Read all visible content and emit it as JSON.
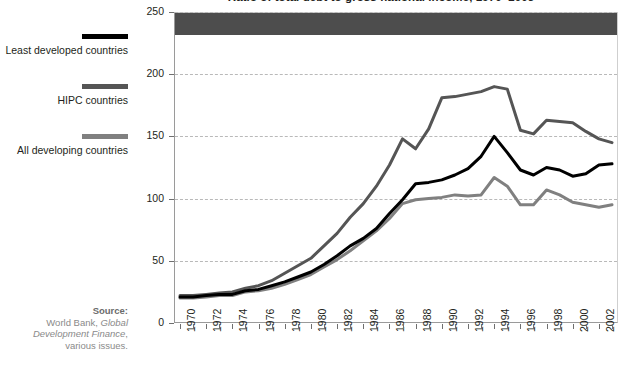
{
  "title": "Ratio of total debt to gross national income, 1970–2003",
  "legend": {
    "position": "left",
    "items": [
      {
        "label": "Least developed countries",
        "color": "#000000"
      },
      {
        "label": "HIPC countries",
        "color": "#555555"
      },
      {
        "label": "All developing countries",
        "color": "#808080"
      }
    ]
  },
  "source": {
    "heading": "Source:",
    "line1": "World Bank, ",
    "line1_italic": "Global",
    "line2_italic": "Development Finance",
    "line2_tail": ",",
    "line3": "various issues."
  },
  "chart_data": {
    "type": "line",
    "title": "Ratio of total debt to gross national income, 1970–2003",
    "xlabel": "",
    "ylabel": "",
    "ylim": [
      0,
      250
    ],
    "yticks": [
      0,
      50,
      100,
      150,
      200,
      250
    ],
    "grid": true,
    "grid_style": "dashed-horizontal",
    "legend_position": "left",
    "x": [
      1970,
      1971,
      1972,
      1973,
      1974,
      1975,
      1976,
      1977,
      1978,
      1979,
      1980,
      1981,
      1982,
      1983,
      1984,
      1985,
      1986,
      1987,
      1988,
      1989,
      1990,
      1991,
      1992,
      1993,
      1994,
      1995,
      1996,
      1997,
      1998,
      1999,
      2000,
      2001,
      2002,
      2003
    ],
    "xtick_labels": [
      "1970",
      "",
      "1972",
      "",
      "1974",
      "",
      "1976",
      "",
      "1978",
      "",
      "1980",
      "",
      "1982",
      "",
      "1984",
      "",
      "1986",
      "",
      "1988",
      "",
      "1990",
      "",
      "1992",
      "",
      "1994",
      "",
      "1996",
      "",
      "1998",
      "",
      "2000",
      "",
      "2002",
      ""
    ],
    "series": [
      {
        "name": "Least developed countries",
        "color": "#000000",
        "values": [
          21,
          21,
          22,
          23,
          23,
          26,
          27,
          30,
          33,
          37,
          41,
          47,
          54,
          62,
          68,
          76,
          88,
          99,
          112,
          113,
          115,
          119,
          124,
          134,
          150,
          137,
          123,
          119,
          125,
          123,
          118,
          120,
          127,
          128
        ]
      },
      {
        "name": "HIPC countries",
        "color": "#555555",
        "values": [
          22,
          22,
          23,
          24,
          25,
          28,
          30,
          34,
          40,
          46,
          52,
          62,
          72,
          85,
          96,
          110,
          127,
          148,
          140,
          156,
          181,
          182,
          184,
          186,
          190,
          188,
          155,
          152,
          163,
          162,
          161,
          154,
          148,
          145
        ]
      },
      {
        "name": "All developing countries",
        "color": "#808080",
        "values": [
          20,
          20,
          21,
          22,
          22,
          25,
          26,
          28,
          31,
          35,
          39,
          45,
          51,
          58,
          66,
          74,
          84,
          96,
          99,
          100,
          101,
          103,
          102,
          103,
          117,
          110,
          95,
          95,
          107,
          103,
          97,
          95,
          93,
          95
        ]
      }
    ]
  }
}
